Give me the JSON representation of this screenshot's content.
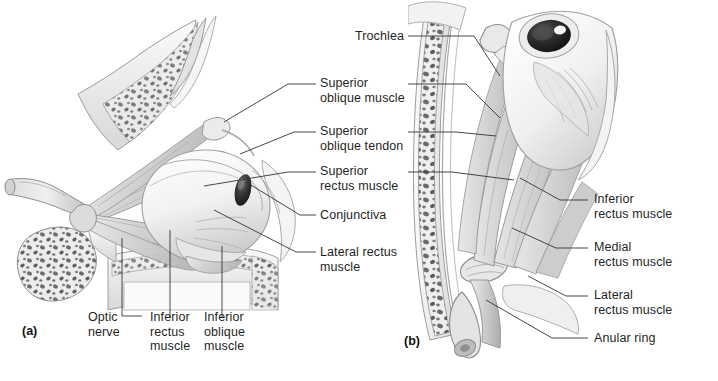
{
  "figure": {
    "background_color": "#ffffff",
    "ink_color": "#333333",
    "panels": [
      {
        "id": "panel-a",
        "panel_label": "(a)",
        "view": "lateral view of right orbit",
        "labels": [
          {
            "name": "superior-oblique-muscle",
            "text": "Superior\noblique muscle"
          },
          {
            "name": "superior-oblique-tendon",
            "text": "Superior\noblique tendon"
          },
          {
            "name": "superior-rectus-muscle",
            "text": "Superior\nrectus muscle"
          },
          {
            "name": "conjunctiva",
            "text": "Conjunctiva"
          },
          {
            "name": "lateral-rectus-muscle",
            "text": "Lateral rectus\nmuscle"
          },
          {
            "name": "optic-nerve",
            "text": "Optic\nnerve"
          },
          {
            "name": "inferior-rectus-muscle",
            "text": "Inferior\nrectus\nmuscle"
          },
          {
            "name": "inferior-oblique-muscle",
            "text": "Inferior\noblique\nmuscle"
          }
        ]
      },
      {
        "id": "panel-b",
        "panel_label": "(b)",
        "view": "superior view of right orbit",
        "labels": [
          {
            "name": "trochlea",
            "text": "Trochlea"
          },
          {
            "name": "inferior-rectus-muscle",
            "text": "Inferior\nrectus muscle"
          },
          {
            "name": "medial-rectus-muscle",
            "text": "Medial\nrectus muscle"
          },
          {
            "name": "lateral-rectus-muscle",
            "text": "Lateral\nrectus muscle"
          },
          {
            "name": "anular-ring",
            "text": "Anular ring"
          }
        ]
      }
    ]
  },
  "labels_center_column": {
    "superior_oblique_muscle": "Superior\noblique muscle",
    "superior_oblique_tendon": "Superior\noblique tendon",
    "superior_rectus_muscle": "Superior\nrectus muscle",
    "conjunctiva": "Conjunctiva",
    "lateral_rectus_muscle": "Lateral rectus\nmuscle"
  },
  "labels_bottom_left": {
    "optic_nerve": "Optic\nnerve",
    "inferior_rectus_muscle": "Inferior\nrectus\nmuscle",
    "inferior_oblique_muscle": "Inferior\noblique\nmuscle",
    "panel_a": "(a)"
  },
  "labels_right": {
    "trochlea": "Trochlea",
    "inferior_rectus_muscle": "Inferior\nrectus muscle",
    "medial_rectus_muscle": "Medial\nrectus muscle",
    "lateral_rectus_muscle": "Lateral\nrectus muscle",
    "anular_ring": "Anular ring",
    "panel_b": "(b)"
  }
}
